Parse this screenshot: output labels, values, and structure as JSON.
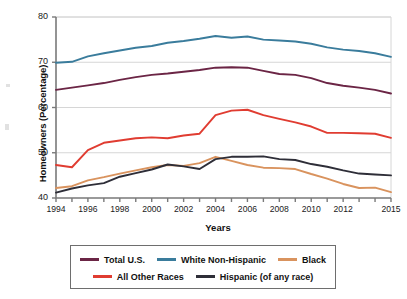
{
  "chart_data": {
    "type": "line",
    "title": "",
    "xlabel": "Years",
    "ylabel": "Homeowners (Percentage)",
    "ylim": [
      40,
      80
    ],
    "xlim": [
      1994,
      2015
    ],
    "yticks": [
      40,
      50,
      60,
      70,
      80
    ],
    "ytick_labels": [
      "40",
      "50",
      "60",
      "70",
      "80"
    ],
    "xticks": [
      1994,
      1995,
      1996,
      1997,
      1998,
      1999,
      2000,
      2001,
      2002,
      2003,
      2004,
      2005,
      2006,
      2007,
      2008,
      2009,
      2010,
      2011,
      2012,
      2013,
      2014,
      2015
    ],
    "xtick_labels_shown": [
      "1994",
      "1996",
      "1998",
      "2000",
      "2002",
      "2004",
      "2006",
      "2008",
      "2010",
      "2012",
      "2015"
    ],
    "grid": "horizontal",
    "legend_position": "below",
    "x": [
      1994,
      1995,
      1996,
      1997,
      1998,
      1999,
      2000,
      2001,
      2002,
      2003,
      2004,
      2005,
      2006,
      2007,
      2008,
      2009,
      2010,
      2011,
      2012,
      2013,
      2014,
      2015
    ],
    "series": [
      {
        "name": "Total U.S.",
        "color": "#6b2545",
        "values": [
          63.9,
          64.4,
          64.9,
          65.4,
          66.1,
          66.7,
          67.2,
          67.5,
          67.9,
          68.3,
          68.8,
          68.9,
          68.8,
          68.1,
          67.4,
          67.2,
          66.5,
          65.4,
          64.8,
          64.4,
          63.9,
          63.1
        ]
      },
      {
        "name": "White Non-Hispanic",
        "color": "#3a7c9c",
        "values": [
          69.9,
          70.1,
          71.3,
          72.0,
          72.6,
          73.2,
          73.6,
          74.3,
          74.7,
          75.2,
          75.8,
          75.4,
          75.7,
          75.0,
          74.8,
          74.6,
          74.1,
          73.3,
          72.8,
          72.5,
          72.0,
          71.2
        ]
      },
      {
        "name": "Black",
        "color": "#d9935e",
        "values": [
          42.2,
          42.6,
          43.9,
          44.6,
          45.4,
          46.1,
          46.8,
          47.3,
          47.1,
          47.7,
          49.1,
          48.2,
          47.3,
          46.7,
          46.6,
          46.4,
          45.3,
          44.3,
          43.1,
          42.2,
          42.3,
          41.3
        ]
      },
      {
        "name": "All Other Races",
        "color": "#e03c31",
        "values": [
          47.3,
          46.8,
          50.6,
          52.2,
          52.7,
          53.2,
          53.4,
          53.2,
          53.8,
          54.2,
          58.3,
          59.3,
          59.5,
          58.3,
          57.5,
          56.7,
          55.8,
          54.4,
          54.4,
          54.3,
          54.2,
          53.3
        ]
      },
      {
        "name": "Hispanic (of any race)",
        "color": "#2e2e38",
        "values": [
          41.2,
          42.1,
          42.8,
          43.3,
          44.7,
          45.5,
          46.3,
          47.4,
          47.0,
          46.4,
          48.6,
          49.1,
          49.1,
          49.2,
          48.6,
          48.4,
          47.5,
          46.9,
          46.1,
          45.4,
          45.2,
          45.0
        ]
      }
    ]
  },
  "legend": {
    "rows": [
      [
        {
          "label": "Total U.S.",
          "color": "#6b2545"
        },
        {
          "label": "White Non-Hispanic",
          "color": "#3a7c9c"
        },
        {
          "label": "Black",
          "color": "#d9935e"
        }
      ],
      [
        {
          "label": "All Other Races",
          "color": "#e03c31"
        },
        {
          "label": "Hispanic (of any race)",
          "color": "#2e2e38"
        }
      ]
    ]
  }
}
